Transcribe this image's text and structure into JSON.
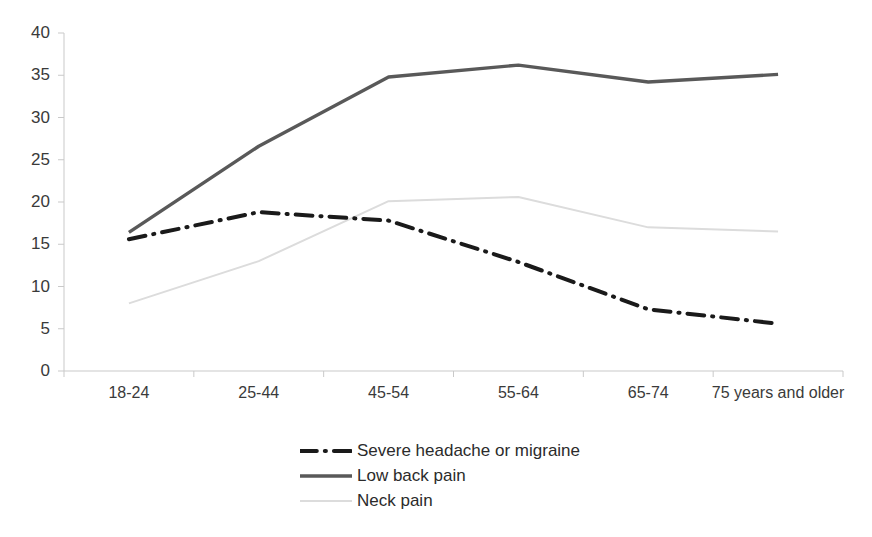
{
  "chart_data": {
    "type": "line",
    "title": "",
    "subtitle": "",
    "xlabel": "",
    "ylabel": "",
    "categories": [
      "18-24",
      "25-44",
      "45-54",
      "55-64",
      "65-74",
      "75 years and older"
    ],
    "ylim": [
      0,
      40
    ],
    "yticks": [
      0,
      5,
      10,
      15,
      20,
      25,
      30,
      35,
      40
    ],
    "ytick_labels": [
      "0",
      "5",
      "10",
      "15",
      "20",
      "25",
      "30",
      "35",
      "40"
    ],
    "grid": false,
    "legend_position": "bottom",
    "series": [
      {
        "name": "Severe headache or migraine",
        "values": [
          15.6,
          18.8,
          17.8,
          12.9,
          7.3,
          5.6
        ],
        "color": "#1a1a1a",
        "style": "dash-dot",
        "width": 4
      },
      {
        "name": "Low back pain",
        "values": [
          16.4,
          26.6,
          34.8,
          36.2,
          34.2,
          35.1
        ],
        "color": "#595959",
        "style": "solid",
        "width": 3.4
      },
      {
        "name": "Neck pain",
        "values": [
          8.0,
          13.0,
          20.1,
          20.6,
          17.0,
          16.5
        ],
        "color": "#dcdcdc",
        "style": "solid",
        "width": 2
      }
    ]
  },
  "axis": {
    "axis_color": "#c9c9c9",
    "tick_color": "#c9c9c9"
  },
  "legend": {
    "items": [
      {
        "label": "Severe headache or migraine"
      },
      {
        "label": "Low back pain"
      },
      {
        "label": "Neck pain"
      }
    ]
  }
}
